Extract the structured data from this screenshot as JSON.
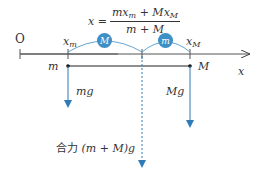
{
  "diagram": {
    "origin_label": "O",
    "axis_label": "x",
    "formula": {
      "lhs": "x =",
      "numerator": "mx_m + Mx_M",
      "numerator_parts": {
        "a": "mx",
        "a_sub": "m",
        "plus": " + Mx",
        "b_sub": "M"
      },
      "denominator": "m + M"
    },
    "positions": {
      "xm_label": "x",
      "xm_sub": "m",
      "xM_label": "x",
      "xM_sub": "M"
    },
    "masses": {
      "left": "m",
      "right": "M"
    },
    "balls": {
      "left_ball": "M",
      "right_ball": "m"
    },
    "forces": {
      "left": "mg",
      "right": "Mg"
    },
    "resultant_label": "合力 (m + M)g",
    "resultant_prefix": "合力",
    "resultant_expr": "(m + M)g",
    "colors": {
      "accent": "#3e8fc6",
      "line": "#333333",
      "arrow": "#2e7bb8"
    }
  }
}
